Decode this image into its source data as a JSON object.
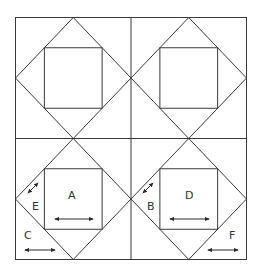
{
  "diagram": {
    "grid": {
      "rows": 2,
      "cols": 2
    },
    "line_color": "#3a3a3a",
    "labels": [
      {
        "id": "A",
        "text": "A",
        "piece": "center-square",
        "block": "bottom-left",
        "grain": "horizontal"
      },
      {
        "id": "B",
        "text": "B",
        "piece": "diamond-side-triangle",
        "block": "bottom-right",
        "grain": "diagonal"
      },
      {
        "id": "C",
        "text": "C",
        "piece": "corner-triangle",
        "block": "bottom-left",
        "grain": "horizontal"
      },
      {
        "id": "D",
        "text": "D",
        "piece": "center-square",
        "block": "bottom-right",
        "grain": "horizontal"
      },
      {
        "id": "E",
        "text": "E",
        "piece": "diamond-side-triangle",
        "block": "bottom-left",
        "grain": "diagonal"
      },
      {
        "id": "F",
        "text": "F",
        "piece": "corner-triangle",
        "block": "bottom-right",
        "grain": "horizontal"
      }
    ]
  }
}
